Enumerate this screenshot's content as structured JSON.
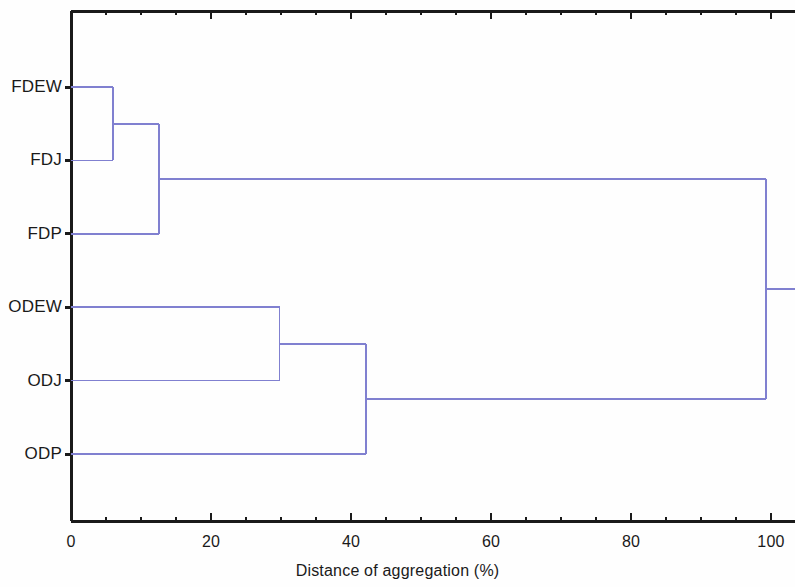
{
  "chart_data": {
    "type": "dendrogram",
    "title": "",
    "xlabel": "Distance of aggregation (%)",
    "ylabel": "",
    "xlim": [
      0,
      103
    ],
    "xticks": [
      0,
      20,
      40,
      60,
      80,
      100
    ],
    "xticklabels": [
      "0",
      "20",
      "40",
      "60",
      "80",
      "100"
    ],
    "minor_tick_step": 5,
    "grid": false,
    "legend": null,
    "line_color": "#8080d0",
    "axis_color": "#1a1a1a",
    "background_color": "#fefefe",
    "leaves": [
      {
        "label": "FDEW",
        "order": 0
      },
      {
        "label": "FDJ",
        "order": 1
      },
      {
        "label": "FDP",
        "order": 2
      },
      {
        "label": "ODEW",
        "order": 3
      },
      {
        "label": "ODJ",
        "order": 4
      },
      {
        "label": "ODP",
        "order": 5
      }
    ],
    "merges": [
      {
        "id": "m1",
        "children": [
          "FDEW",
          "FDJ"
        ],
        "distance": 6.0
      },
      {
        "id": "m2",
        "children": [
          "m1",
          "FDP"
        ],
        "distance": 12.6
      },
      {
        "id": "m3",
        "children": [
          "ODEW",
          "ODJ"
        ],
        "distance": 29.8
      },
      {
        "id": "m4",
        "children": [
          "m3",
          "ODP"
        ],
        "distance": 42.1
      },
      {
        "id": "m5",
        "children": [
          "m2",
          "m4"
        ],
        "distance": 99.3
      }
    ]
  },
  "axis": {
    "x_title": "Distance of aggregation (%)",
    "tick_labels": [
      "0",
      "20",
      "40",
      "60",
      "80",
      "100"
    ]
  },
  "leaf_labels": {
    "fdew": "FDEW",
    "fdj": "FDJ",
    "fdp": "FDP",
    "odew": "ODEW",
    "odj": "ODJ",
    "odp": "ODP"
  }
}
